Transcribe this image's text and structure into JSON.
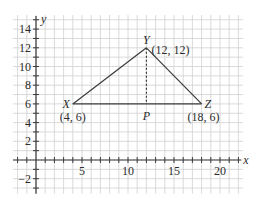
{
  "figure": {
    "type": "coordinate-geometry-diagram",
    "axes": {
      "x_label": "x",
      "y_label": "y",
      "x_ticks": [
        {
          "value": 5,
          "label": "5"
        },
        {
          "value": 10,
          "label": "10"
        },
        {
          "value": 15,
          "label": "15"
        },
        {
          "value": 20,
          "label": "20"
        }
      ],
      "y_ticks": [
        {
          "value": 14,
          "label": "14"
        },
        {
          "value": 12,
          "label": "12"
        },
        {
          "value": 10,
          "label": "10"
        },
        {
          "value": 8,
          "label": "8"
        },
        {
          "value": 6,
          "label": "6"
        },
        {
          "value": 4,
          "label": "4"
        },
        {
          "value": 2,
          "label": "2"
        },
        {
          "value": -2,
          "label": "−2"
        }
      ],
      "x_range": [
        -2.5,
        22.5
      ],
      "y_range": [
        -3.5,
        15.5
      ]
    },
    "points": {
      "X": {
        "name": "X",
        "coords_label": "(4, 6)",
        "x": 4,
        "y": 6
      },
      "Y": {
        "name": "Y",
        "coords_label": "(12, 12)",
        "x": 12,
        "y": 12
      },
      "Z": {
        "name": "Z",
        "coords_label": "(18, 6)",
        "x": 18,
        "y": 6
      },
      "P": {
        "name": "P",
        "x": 12,
        "y": 6
      }
    },
    "segments": [
      {
        "from": "X",
        "to": "Y",
        "style": "solid"
      },
      {
        "from": "Y",
        "to": "Z",
        "style": "solid"
      },
      {
        "from": "X",
        "to": "Z",
        "style": "solid"
      },
      {
        "from": "Y",
        "to": "P",
        "style": "dashed"
      }
    ],
    "colors": {
      "grid": "#d0d0d0",
      "axis": "#3a3a3a",
      "line": "#3a3a3a",
      "text": "#2b2b2b"
    }
  }
}
